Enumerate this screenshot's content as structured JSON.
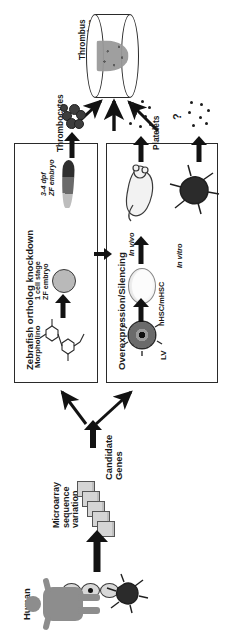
{
  "figure": {
    "orientation": "rotated-90-ccw"
  },
  "top": {
    "thrombus_label": "Thrombus\nFormation",
    "vessel_name": "blood-vessel-with-thrombus"
  },
  "left_panel": {
    "title": "Zebrafish ortholog knockdown",
    "readout_label": "Thrombocytes",
    "embryo_stage_label": "3-4 dpf\nZF embryo",
    "one_cell_label": "1 cell stage\nZF embryo",
    "reagent_label": "Morpholino"
  },
  "right_panel": {
    "title": "Overexpression/Silencing",
    "readout_label": "Platelets",
    "in_vivo_label": "In vivo",
    "in_vitro_label": "In vitro",
    "cells_label": "hHSC/mHSC",
    "vector_label": "LV",
    "uncertain_marker": "?"
  },
  "bottom": {
    "candidate_genes_label": "Candidate\nGenes",
    "microarray_label": "Microarray\nsequence\nvariation",
    "human_label": "Human"
  },
  "colors": {
    "stroke": "#2a2a2a",
    "arrow": "#121212",
    "cell_fill": "#b9b9b9",
    "chip_fill": "#d5d5d5",
    "human_fill": "#8d8d8d",
    "background": "#ffffff"
  }
}
